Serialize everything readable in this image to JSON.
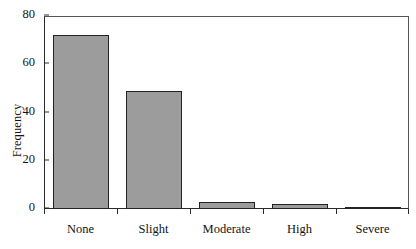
{
  "chart_data": {
    "type": "bar",
    "title": "",
    "xlabel": "",
    "ylabel": "Frequency",
    "categories": [
      "None",
      "Slight",
      "Moderate",
      "High",
      "Severe"
    ],
    "values": [
      72,
      49,
      3,
      2,
      1
    ],
    "ylim": [
      0,
      80
    ],
    "yticks": [
      0,
      20,
      40,
      60,
      80
    ],
    "ytick_labels": [
      "0",
      "20",
      "40",
      "60",
      "80"
    ],
    "grid": false,
    "legend": null,
    "bar_fill_color": "#9c9c9c",
    "bar_edge_color": "#232323",
    "axis_color": "#2b2b2b",
    "background_color": "#ffffff"
  }
}
